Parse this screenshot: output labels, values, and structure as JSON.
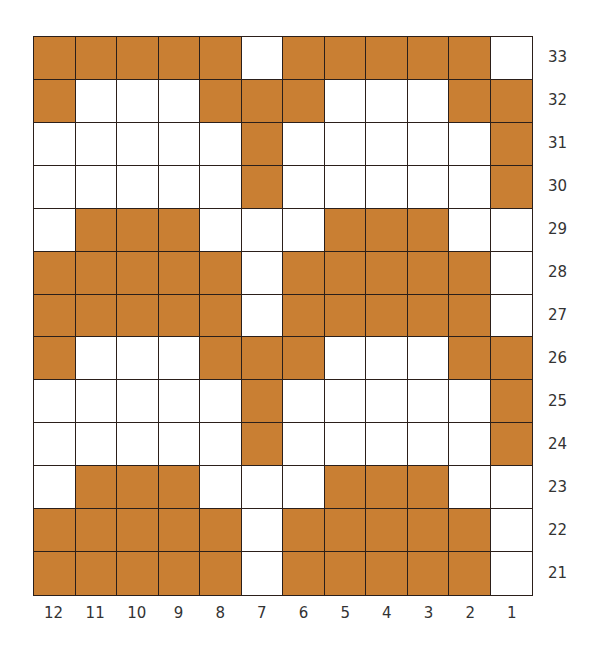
{
  "chart_data": {
    "type": "table",
    "title": "",
    "colors": {
      "filled": "#c97f33",
      "empty": "#ffffff",
      "grid_line": "#2b1f1a"
    },
    "column_labels": [
      "12",
      "11",
      "10",
      "9",
      "8",
      "7",
      "6",
      "5",
      "4",
      "3",
      "2",
      "1"
    ],
    "row_labels": [
      "33",
      "32",
      "31",
      "30",
      "29",
      "28",
      "27",
      "26",
      "25",
      "24",
      "23",
      "22",
      "21"
    ],
    "rows": [
      [
        1,
        1,
        1,
        1,
        1,
        0,
        1,
        1,
        1,
        1,
        1,
        0
      ],
      [
        1,
        0,
        0,
        0,
        1,
        1,
        1,
        0,
        0,
        0,
        1,
        1
      ],
      [
        0,
        0,
        0,
        0,
        0,
        1,
        0,
        0,
        0,
        0,
        0,
        1
      ],
      [
        0,
        0,
        0,
        0,
        0,
        1,
        0,
        0,
        0,
        0,
        0,
        1
      ],
      [
        0,
        1,
        1,
        1,
        0,
        0,
        0,
        1,
        1,
        1,
        0,
        0
      ],
      [
        1,
        1,
        1,
        1,
        1,
        0,
        1,
        1,
        1,
        1,
        1,
        0
      ],
      [
        1,
        1,
        1,
        1,
        1,
        0,
        1,
        1,
        1,
        1,
        1,
        0
      ],
      [
        1,
        0,
        0,
        0,
        1,
        1,
        1,
        0,
        0,
        0,
        1,
        1
      ],
      [
        0,
        0,
        0,
        0,
        0,
        1,
        0,
        0,
        0,
        0,
        0,
        1
      ],
      [
        0,
        0,
        0,
        0,
        0,
        1,
        0,
        0,
        0,
        0,
        0,
        1
      ],
      [
        0,
        1,
        1,
        1,
        0,
        0,
        0,
        1,
        1,
        1,
        0,
        0
      ],
      [
        1,
        1,
        1,
        1,
        1,
        0,
        1,
        1,
        1,
        1,
        1,
        0
      ],
      [
        1,
        1,
        1,
        1,
        1,
        0,
        1,
        1,
        1,
        1,
        1,
        0
      ]
    ]
  }
}
